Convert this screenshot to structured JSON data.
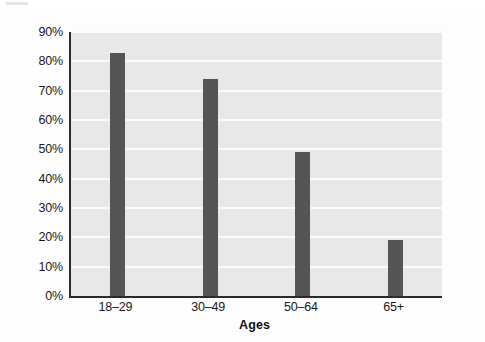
{
  "chart_data": {
    "type": "bar",
    "title": "",
    "xlabel": "Ages",
    "ylabel": "",
    "categories": [
      "18–29",
      "30–49",
      "50–64",
      "65+"
    ],
    "values": [
      83,
      74,
      49,
      19
    ],
    "value_labels": [
      "83%",
      "74%",
      "49%",
      "19%"
    ],
    "ylim": [
      0,
      90
    ],
    "ytick_labels": [
      "0%",
      "10%",
      "20%",
      "30%",
      "40%",
      "50%",
      "60%",
      "70%",
      "80%",
      "90%"
    ],
    "ytick_values": [
      0,
      10,
      20,
      30,
      40,
      50,
      60,
      70,
      80,
      90
    ],
    "grid": true,
    "grid_orientation": "horizontal",
    "legend": null,
    "legend_position": "none",
    "colors": {
      "bar": "#555555",
      "plot_background": "#e8e8e8",
      "gridline": "#fafafa",
      "axis_line": "#2b2b2b",
      "figure_background": "#fdfdfd",
      "text": "#1a1a1a"
    }
  }
}
